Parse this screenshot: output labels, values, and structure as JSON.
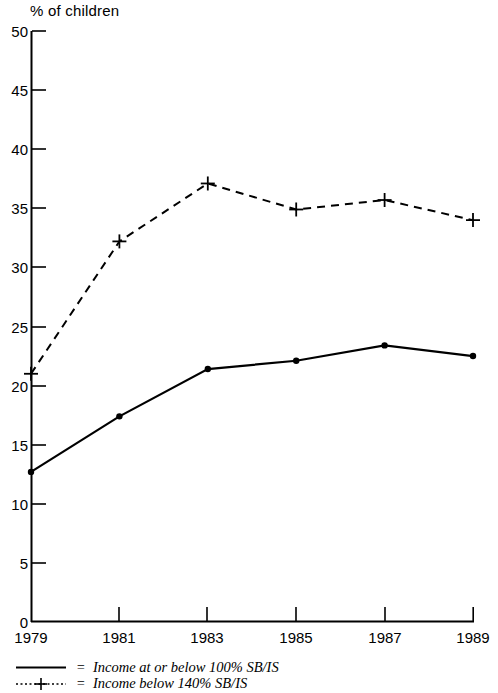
{
  "axis_title": "% of children",
  "legend": {
    "equals": "=",
    "entries": [
      {
        "label": "Income at or below 100% SB/IS",
        "style": "solid-line",
        "marker": "dot"
      },
      {
        "label": "Income below 140% SB/IS",
        "style": "dotted-line",
        "marker": "plus"
      }
    ]
  },
  "chart_data": {
    "type": "line",
    "title": "",
    "subtitle": "",
    "xlabel": "",
    "ylabel": "% of children",
    "x": [
      1979,
      1981,
      1983,
      1985,
      1987,
      1989
    ],
    "categories": [
      "1979",
      "1981",
      "1983",
      "1985",
      "1987",
      "1989"
    ],
    "xlim": [
      1979,
      1989
    ],
    "ylim": [
      0,
      50
    ],
    "ytick_labels": [
      "0",
      "5",
      "10",
      "15",
      "20",
      "25",
      "30",
      "35",
      "40",
      "45",
      "50"
    ],
    "yticks": [
      0,
      5,
      10,
      15,
      20,
      25,
      30,
      35,
      40,
      45,
      50
    ],
    "xtick_labels": [
      "1979",
      "1981",
      "1983",
      "1985",
      "1987",
      "1989"
    ],
    "grid": false,
    "legend_position": "below-axes",
    "series": [
      {
        "name": "Income at or below 100% SB/IS",
        "values": [
          12.7,
          17.4,
          21.4,
          22.1,
          23.4,
          22.5
        ],
        "line_style": "solid",
        "marker": "dot",
        "color": "#000000"
      },
      {
        "name": "Income below 140% SB/IS",
        "values": [
          21.0,
          32.2,
          37.1,
          34.9,
          35.7,
          34.0
        ],
        "line_style": "dashed",
        "marker": "plus",
        "color": "#000000"
      }
    ]
  }
}
